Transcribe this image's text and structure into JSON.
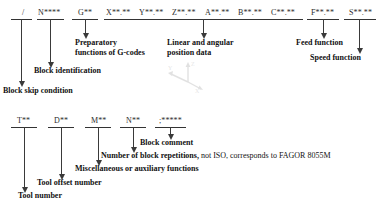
{
  "diagram": {
    "tokens": [
      {
        "id": "block-skip",
        "text": "/"
      },
      {
        "id": "block-number",
        "text": "N****"
      },
      {
        "id": "g-code",
        "text": "G**"
      },
      {
        "id": "axis-x",
        "text": "X**.**"
      },
      {
        "id": "axis-y",
        "text": "Y**.**"
      },
      {
        "id": "axis-z",
        "text": "Z**.**"
      },
      {
        "id": "axis-a",
        "text": "A**.**"
      },
      {
        "id": "axis-b",
        "text": "B**.**"
      },
      {
        "id": "axis-c",
        "text": "C**.**"
      },
      {
        "id": "feed",
        "text": "F**.**"
      },
      {
        "id": "speed",
        "text": "S**.**"
      },
      {
        "id": "tool",
        "text": "T**"
      },
      {
        "id": "tool-offset",
        "text": "D**"
      },
      {
        "id": "m-code",
        "text": "M**"
      },
      {
        "id": "repetitions",
        "text": "N**"
      },
      {
        "id": "comment",
        "text": ";*****"
      }
    ],
    "annotations": [
      {
        "id": "preparatory",
        "line1": "Preparatory",
        "line2": "functions of G-codes"
      },
      {
        "id": "position-data",
        "line1": "Linear and angular",
        "line2": "position data"
      },
      {
        "id": "feed-function",
        "text": "Feed function"
      },
      {
        "id": "speed-function",
        "text": "Speed function"
      },
      {
        "id": "block-identification",
        "text": "Block identification"
      },
      {
        "id": "block-skip-condition",
        "text": "Block skip condition"
      },
      {
        "id": "block-comment",
        "text": "Block comment"
      },
      {
        "id": "repetitions-note",
        "bold": "Number of block repetitions,",
        "plain": " not ISO, corresponds to FAGOR 8055M"
      },
      {
        "id": "misc-functions",
        "text": "Miscellaneous or auxiliary functions"
      },
      {
        "id": "tool-offset-number",
        "text": "Tool offset number"
      },
      {
        "id": "tool-number",
        "text": "Tool number"
      }
    ],
    "colors": {
      "background": "#ffffff",
      "ink": "#1a1a1a",
      "rule": "#333333",
      "connector": "#3a3a3a"
    }
  }
}
